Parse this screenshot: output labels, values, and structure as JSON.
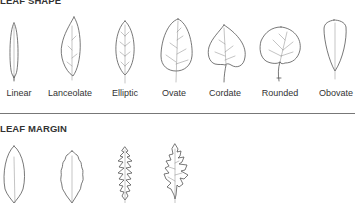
{
  "sections": [
    {
      "title": "LEAF SHAPE",
      "items": [
        {
          "label": "Linear",
          "icon": "linear-leaf-icon"
        },
        {
          "label": "Lanceolate",
          "icon": "lanceolate-leaf-icon"
        },
        {
          "label": "Elliptic",
          "icon": "elliptic-leaf-icon"
        },
        {
          "label": "Ovate",
          "icon": "ovate-leaf-icon"
        },
        {
          "label": "Cordate",
          "icon": "cordate-leaf-icon"
        },
        {
          "label": "Rounded",
          "icon": "rounded-leaf-icon"
        },
        {
          "label": "Obovate",
          "icon": "obovate-leaf-icon"
        }
      ]
    },
    {
      "title": "LEAF MARGIN",
      "items": [
        {
          "icon": "entire-margin-leaf-icon"
        },
        {
          "icon": "crenate-margin-leaf-icon"
        },
        {
          "icon": "serrate-margin-leaf-icon"
        },
        {
          "icon": "lobed-margin-leaf-icon"
        }
      ]
    }
  ],
  "colors": {
    "text": "#333333",
    "stroke": "#555555",
    "divider": "#777777"
  }
}
